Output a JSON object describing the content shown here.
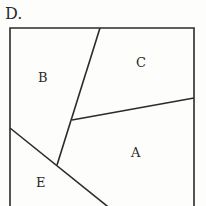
{
  "figure": {
    "option_label": "D.",
    "regions": [
      {
        "id": "A",
        "label": "A"
      },
      {
        "id": "B",
        "label": "B"
      },
      {
        "id": "C",
        "label": "C"
      },
      {
        "id": "D",
        "label": "E"
      }
    ],
    "labels": {
      "a": "A",
      "b": "B",
      "c": "C",
      "e": "E"
    },
    "colors": {
      "line": "#2b2b2b",
      "background": "#fdfdfc"
    }
  }
}
